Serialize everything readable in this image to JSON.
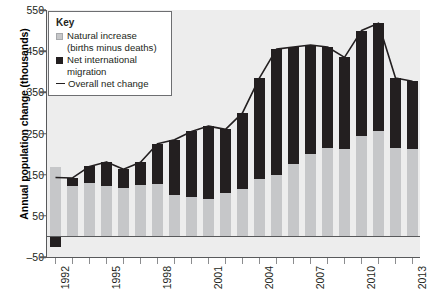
{
  "chart_data": {
    "type": "bar",
    "title": "",
    "xlabel": "",
    "ylabel": "Annual population change (thousands)",
    "ylim": [
      -50,
      550
    ],
    "yticks": [
      -50,
      50,
      150,
      250,
      350,
      450,
      550
    ],
    "ytick_labels": [
      "–50",
      "50",
      "150",
      "250",
      "350",
      "450",
      "550"
    ],
    "xtick_labels": [
      "1992",
      "1995",
      "1998",
      "2001",
      "2004",
      "2007",
      "2010",
      "2013"
    ],
    "grid": false,
    "legend_position": "top-left",
    "stacked": true,
    "categories": [
      "1992",
      "1993",
      "1994",
      "1995",
      "1996",
      "1997",
      "1998",
      "1999",
      "2000",
      "2001",
      "2002",
      "2003",
      "2004",
      "2005",
      "2006",
      "2007",
      "2008",
      "2009",
      "2010",
      "2011",
      "2012",
      "2013"
    ],
    "series": [
      {
        "name": "Natural increase (births minus deaths)",
        "color": "#c6c7c9",
        "values": [
          168,
          122,
          130,
          123,
          118,
          125,
          128,
          100,
          95,
          90,
          105,
          115,
          140,
          150,
          175,
          200,
          215,
          213,
          245,
          255,
          215,
          212
        ]
      },
      {
        "name": "Net international migration",
        "color": "#231f20",
        "values": [
          -25,
          20,
          40,
          58,
          45,
          55,
          97,
          135,
          160,
          178,
          155,
          185,
          245,
          305,
          285,
          265,
          245,
          222,
          255,
          263,
          170,
          165
        ]
      }
    ],
    "overall_net_change": {
      "name": "Overall net change",
      "color": "#231f20",
      "values": [
        143,
        142,
        170,
        181,
        163,
        180,
        225,
        235,
        255,
        268,
        260,
        300,
        385,
        455,
        460,
        465,
        460,
        435,
        500,
        518,
        385,
        377
      ]
    }
  },
  "legend": {
    "title": "Key",
    "items": [
      {
        "label": "Natural increase (births minus deaths)",
        "swatch": "nat"
      },
      {
        "label": "Net international migration",
        "swatch": "mig"
      },
      {
        "label": "Overall net change",
        "swatch": "line"
      }
    ]
  }
}
